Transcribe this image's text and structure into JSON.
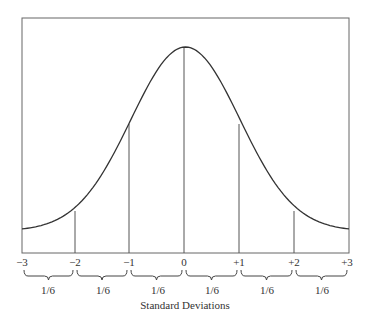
{
  "chart_data": {
    "type": "line",
    "title": "",
    "xlabel": "Standard Deviations",
    "ylabel": "",
    "x_ticks": [
      "−3",
      "−2",
      "−1",
      "0",
      "+1",
      "+2",
      "+3"
    ],
    "x_range": [
      -3,
      3
    ],
    "grid": false,
    "legend": null,
    "series": [
      {
        "name": "Normal curve",
        "x": [
          -3,
          -2.5,
          -2,
          -1.5,
          -1,
          -0.5,
          0,
          0.5,
          1,
          1.5,
          2,
          2.5,
          3
        ],
        "y": [
          0.011,
          0.044,
          0.135,
          0.325,
          0.607,
          0.882,
          1.0,
          0.882,
          0.607,
          0.325,
          0.135,
          0.044,
          0.011
        ]
      }
    ],
    "vertical_lines_at": [
      -2,
      -1,
      0,
      1,
      2
    ],
    "interval_annotations": [
      {
        "from": -3,
        "to": -2,
        "label": "1/6"
      },
      {
        "from": -2,
        "to": -1,
        "label": "1/6"
      },
      {
        "from": -1,
        "to": 0,
        "label": "1/6"
      },
      {
        "from": 0,
        "to": 1,
        "label": "1/6"
      },
      {
        "from": 1,
        "to": 2,
        "label": "1/6"
      },
      {
        "from": 2,
        "to": 3,
        "label": "1/6"
      }
    ]
  }
}
